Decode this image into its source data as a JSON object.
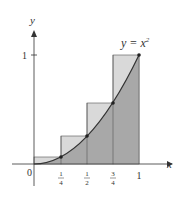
{
  "diagram": {
    "type": "riemann-sum-upper",
    "function_label": "y = x",
    "function_exponent": "2",
    "axis_labels": {
      "x": "x",
      "y": "y"
    },
    "origin_label": "0",
    "y_tick_label": "1",
    "x_ticks": [
      {
        "num": "1",
        "den": "4"
      },
      {
        "num": "1",
        "den": "2"
      },
      {
        "num": "3",
        "den": "4"
      },
      {
        "label": "1"
      }
    ],
    "rectangles": [
      {
        "x0": 0,
        "x1": 0.25,
        "height": 0.0625
      },
      {
        "x0": 0.25,
        "x1": 0.5,
        "height": 0.25
      },
      {
        "x0": 0.5,
        "x1": 0.75,
        "height": 0.5625
      },
      {
        "x0": 0.75,
        "x1": 1.0,
        "height": 1.0
      }
    ],
    "points": [
      [
        0.25,
        0.0625
      ],
      [
        0.5,
        0.25
      ],
      [
        0.75,
        0.5625
      ],
      [
        1,
        1
      ]
    ],
    "colors": {
      "rect_fill": "#d9d9d9",
      "under_curve_fill": "#a8a8a8",
      "stroke": "#333333"
    }
  }
}
